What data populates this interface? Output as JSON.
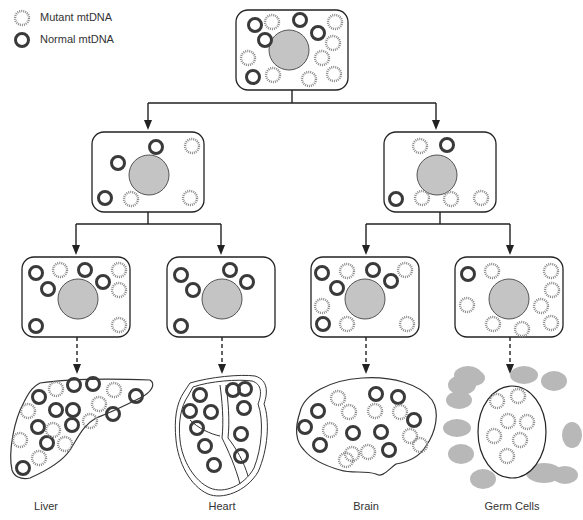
{
  "legend": {
    "mutant_label": "Mutant mtDNA",
    "normal_label": "Normal mtDNA"
  },
  "colors": {
    "normal": "#3a3a3a",
    "mutant": "#8a8a8a",
    "nucleus": "#c4c4c4",
    "germ_blob": "#b8b8b8",
    "line": "#222222"
  },
  "tissues": [
    {
      "label": "Liver",
      "x": 46
    },
    {
      "label": "Heart",
      "x": 222
    },
    {
      "label": "Brain",
      "x": 366
    },
    {
      "label": "Germ Cells",
      "x": 512
    }
  ],
  "cells": {
    "root": {
      "x": 236,
      "y": 10,
      "w": 112,
      "h": 80,
      "nucleus": {
        "cx": 289,
        "cy": 50,
        "r": 20
      },
      "normal": [
        [
          255,
          25
        ],
        [
          300,
          20
        ],
        [
          318,
          33
        ],
        [
          265,
          40
        ],
        [
          253,
          77
        ]
      ],
      "mutant": [
        [
          272,
          22
        ],
        [
          335,
          22
        ],
        [
          333,
          43
        ],
        [
          248,
          58
        ],
        [
          322,
          58
        ],
        [
          273,
          75
        ],
        [
          309,
          79
        ],
        [
          334,
          74
        ]
      ]
    },
    "gen1": [
      {
        "x": 92,
        "y": 132,
        "w": 112,
        "h": 80,
        "nucleus": {
          "cx": 149,
          "cy": 175,
          "r": 20
        },
        "normal": [
          [
            156,
            147
          ],
          [
            118,
            163
          ],
          [
            105,
            198
          ]
        ],
        "mutant": [
          [
            192,
            146
          ],
          [
            131,
            199
          ],
          [
            190,
            198
          ]
        ]
      },
      {
        "x": 384,
        "y": 132,
        "w": 112,
        "h": 80,
        "nucleus": {
          "cx": 437,
          "cy": 175,
          "r": 20
        },
        "normal": [
          [
            447,
            145
          ],
          [
            396,
            199
          ]
        ],
        "mutant": [
          [
            420,
            146
          ],
          [
            422,
            198
          ],
          [
            451,
            199
          ],
          [
            481,
            198
          ]
        ]
      }
    ],
    "gen2": [
      {
        "x": 22,
        "y": 257,
        "w": 108,
        "h": 80,
        "nucleus": {
          "cx": 78,
          "cy": 299,
          "r": 20
        },
        "normal": [
          [
            36,
            273
          ],
          [
            48,
            289
          ],
          [
            85,
            270
          ],
          [
            103,
            282
          ],
          [
            36,
            326
          ]
        ],
        "mutant": [
          [
            60,
            270
          ],
          [
            119,
            270
          ],
          [
            119,
            290
          ],
          [
            119,
            325
          ]
        ]
      },
      {
        "x": 167,
        "y": 257,
        "w": 108,
        "h": 80,
        "nucleus": {
          "cx": 222,
          "cy": 299,
          "r": 20
        },
        "normal": [
          [
            181,
            275
          ],
          [
            193,
            290
          ],
          [
            230,
            270
          ],
          [
            247,
            282
          ],
          [
            181,
            326
          ]
        ],
        "mutant": []
      },
      {
        "x": 311,
        "y": 257,
        "w": 108,
        "h": 80,
        "nucleus": {
          "cx": 365,
          "cy": 299,
          "r": 20
        },
        "normal": [
          [
            322,
            273
          ],
          [
            337,
            288
          ],
          [
            373,
            270
          ],
          [
            391,
            281
          ],
          [
            323,
            324
          ]
        ],
        "mutant": [
          [
            347,
            271
          ],
          [
            405,
            270
          ],
          [
            322,
            306
          ],
          [
            347,
            324
          ],
          [
            407,
            324
          ]
        ]
      },
      {
        "x": 455,
        "y": 257,
        "w": 108,
        "h": 80,
        "nucleus": {
          "cx": 509,
          "cy": 299,
          "r": 20
        },
        "normal": [
          [
            468,
            274
          ]
        ],
        "mutant": [
          [
            492,
            271
          ],
          [
            551,
            271
          ],
          [
            552,
            290
          ],
          [
            467,
            305
          ],
          [
            541,
            306
          ],
          [
            493,
            324
          ],
          [
            522,
            329
          ],
          [
            551,
            323
          ]
        ]
      }
    ]
  },
  "organs": {
    "liver": {
      "normal": [
        [
          39,
          397
        ],
        [
          74,
          385
        ],
        [
          93,
          384
        ],
        [
          136,
          396
        ],
        [
          56,
          410
        ],
        [
          73,
          410
        ],
        [
          113,
          414
        ],
        [
          38,
          427
        ],
        [
          72,
          425
        ],
        [
          47,
          443
        ],
        [
          23,
          468
        ]
      ],
      "mutant": [
        [
          56,
          389
        ],
        [
          114,
          390
        ],
        [
          99,
          404
        ],
        [
          28,
          411
        ],
        [
          90,
          421
        ],
        [
          53,
          430
        ],
        [
          20,
          440
        ],
        [
          65,
          444
        ],
        [
          39,
          458
        ]
      ]
    },
    "heart": {
      "normal": [
        [
          200,
          395
        ],
        [
          233,
          390
        ],
        [
          245,
          389
        ],
        [
          190,
          411
        ],
        [
          211,
          412
        ],
        [
          244,
          408
        ],
        [
          197,
          428
        ],
        [
          241,
          434
        ],
        [
          205,
          446
        ],
        [
          241,
          456
        ],
        [
          214,
          465
        ]
      ],
      "mutant": []
    },
    "brain": {
      "normal": [
        [
          376,
          394
        ],
        [
          398,
          397
        ],
        [
          318,
          411
        ],
        [
          305,
          427
        ],
        [
          353,
          433
        ],
        [
          381,
          432
        ],
        [
          414,
          420
        ],
        [
          320,
          445
        ],
        [
          389,
          450
        ]
      ],
      "mutant": [
        [
          338,
          398
        ],
        [
          349,
          412
        ],
        [
          375,
          411
        ],
        [
          400,
          412
        ],
        [
          330,
          430
        ],
        [
          410,
          436
        ],
        [
          352,
          454
        ],
        [
          368,
          452
        ],
        [
          420,
          445
        ],
        [
          346,
          460
        ]
      ]
    },
    "germ": {
      "cx": 512,
      "cy": 432,
      "rx": 34,
      "ry": 46,
      "mutant": [
        [
          497,
          401
        ],
        [
          518,
          396
        ],
        [
          508,
          421
        ],
        [
          527,
          422
        ],
        [
          494,
          436
        ],
        [
          520,
          440
        ],
        [
          507,
          456
        ]
      ],
      "blobs": [
        [
          462,
          385,
          14,
          10
        ],
        [
          473,
          378,
          12,
          8
        ],
        [
          459,
          400,
          13,
          9
        ],
        [
          524,
          375,
          14,
          9
        ],
        [
          554,
          381,
          13,
          10
        ],
        [
          457,
          428,
          14,
          9
        ],
        [
          572,
          435,
          10,
          13
        ],
        [
          461,
          454,
          13,
          10
        ],
        [
          544,
          473,
          18,
          10
        ],
        [
          565,
          475,
          13,
          9
        ],
        [
          483,
          479,
          13,
          10
        ],
        [
          468,
          375,
          14,
          9
        ]
      ]
    }
  }
}
